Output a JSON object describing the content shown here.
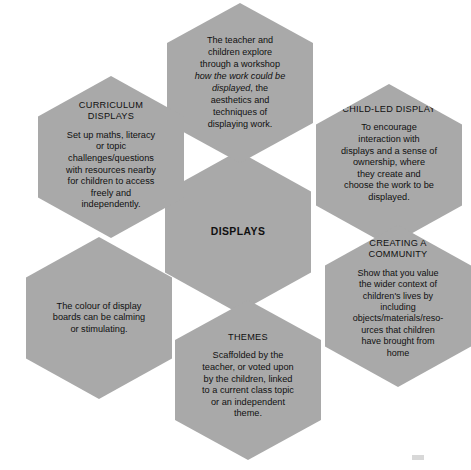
{
  "diagram": {
    "type": "hexagon-cluster",
    "center_label": "DISPLAYS",
    "fill_color": "#a9a9a9",
    "text_color": "#101010",
    "background_color": "#ffffff",
    "cells": [
      {
        "id": "workshop",
        "position": "top",
        "title": "",
        "body_pre": "The teacher and\nchildren explore\nthrough a workshop\n",
        "body_italic": "how the work could be\ndisplayed",
        "body_post": ", the\naesthetics and\ntechniques of\ndisplaying work."
      },
      {
        "id": "curriculum",
        "position": "top-left",
        "title": "CURRICULUM\nDISPLAYS",
        "body": "Set up maths, literacy\nor topic\nchallenges/questions\nwith resources nearby\nfor children to access\nfreely and\nindependently."
      },
      {
        "id": "child-led",
        "position": "top-right",
        "title": "CHILD-LED DISPLAY",
        "body": "To encourage\ninteraction with\ndisplays and a sense of\nownership, where\nthey create and\nchoose the work to be\ndisplayed."
      },
      {
        "id": "colour",
        "position": "bottom-left",
        "title": "",
        "body": "The colour of display\nboards can be calming\nor stimulating."
      },
      {
        "id": "community",
        "position": "bottom-right",
        "title": "CREATING A\nCOMMUNITY",
        "body": "Show that you value\nthe wider context of\nchildren's lives by\nincluding\nobjects/materials/reso-\nurces that children\nhave brought from\nhome"
      },
      {
        "id": "themes",
        "position": "bottom",
        "title": "THEMES",
        "body": "Scaffolded by the\nteacher, or voted upon\nby the children, linked\nto a current class topic\nor an independent\ntheme."
      }
    ]
  }
}
